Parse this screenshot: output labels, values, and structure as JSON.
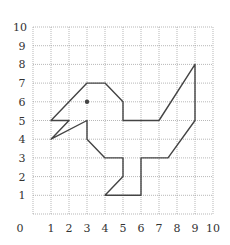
{
  "chart_data": {
    "type": "grid-figure",
    "title": "",
    "x_range": [
      0,
      10
    ],
    "y_range": [
      0,
      10
    ],
    "x_ticks": [
      "0",
      "1",
      "2",
      "3",
      "4",
      "5",
      "6",
      "7",
      "8",
      "9",
      "10"
    ],
    "y_ticks": [
      "1",
      "2",
      "3",
      "4",
      "5",
      "6",
      "7",
      "8",
      "9",
      "10"
    ],
    "grid": true,
    "figure_polygon": [
      [
        7,
        5
      ],
      [
        9,
        8
      ],
      [
        9,
        5
      ],
      [
        7.5,
        3
      ],
      [
        6,
        3
      ],
      [
        6,
        1
      ],
      [
        4,
        1
      ],
      [
        5,
        2
      ],
      [
        5,
        3
      ],
      [
        4,
        3
      ],
      [
        3,
        4
      ],
      [
        3,
        5
      ],
      [
        1,
        4
      ],
      [
        2,
        5
      ],
      [
        1,
        5
      ],
      [
        3,
        7
      ],
      [
        4,
        7
      ],
      [
        5,
        6
      ],
      [
        5,
        5
      ],
      [
        7,
        5
      ]
    ],
    "eye_point": [
      3,
      6
    ],
    "colors": {
      "stroke": "#444444",
      "grid": "#9a9a9a"
    }
  }
}
